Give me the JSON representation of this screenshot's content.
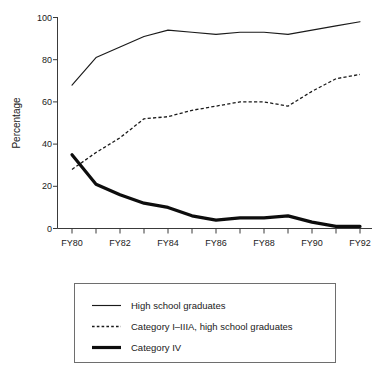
{
  "chart_data": {
    "type": "line",
    "title": "",
    "xlabel": "",
    "ylabel": "Percentage",
    "ylim": [
      0,
      100
    ],
    "yticks": [
      0,
      20,
      40,
      60,
      80,
      100
    ],
    "grid": false,
    "legend_position": "below-plot",
    "x": [
      "FY80",
      "FY81",
      "FY82",
      "FY83",
      "FY84",
      "FY85",
      "FY86",
      "FY87",
      "FY88",
      "FY89",
      "FY90",
      "FY91",
      "FY92"
    ],
    "xtick_labels": [
      "FY80",
      "FY82",
      "FY84",
      "FY86",
      "FY88",
      "FY90",
      "FY92"
    ],
    "xtick_label_years": [
      "FY80",
      "FY81",
      "FY82",
      "FY83",
      "FY84",
      "FY85",
      "FY86",
      "FY87",
      "FY88",
      "FY89",
      "FY90",
      "FY91",
      "FY92"
    ],
    "series": [
      {
        "name": "High school graduates",
        "style": "solid-thin",
        "color": "#1a1a1a",
        "values": [
          68,
          81,
          86,
          91,
          94,
          93,
          92,
          93,
          93,
          92,
          94,
          96,
          98
        ]
      },
      {
        "name": "Category I–IIIA, high school graduates",
        "style": "dashed",
        "color": "#1a1a1a",
        "values": [
          28,
          36,
          43,
          52,
          53,
          56,
          58,
          60,
          60,
          58,
          65,
          71,
          73
        ]
      },
      {
        "name": "Category IV",
        "style": "solid-thick",
        "color": "#0d0d0d",
        "values": [
          35,
          21,
          16,
          12,
          10,
          6,
          4,
          5,
          5,
          6,
          3,
          1,
          1
        ]
      }
    ]
  },
  "axes": {
    "y_label": "Percentage",
    "y_tick_0": "0",
    "y_tick_20": "20",
    "y_tick_40": "40",
    "y_tick_60": "60",
    "y_tick_80": "80",
    "y_tick_100": "100",
    "x_tick_fy80": "FY80",
    "x_tick_fy82": "FY82",
    "x_tick_fy84": "FY84",
    "x_tick_fy86": "FY86",
    "x_tick_fy88": "FY88",
    "x_tick_fy90": "FY90",
    "x_tick_fy92": "FY92"
  },
  "legend": {
    "items": [
      {
        "label": "High school graduates",
        "style": "solid-thin"
      },
      {
        "label": "Category I–IIIA, high school graduates",
        "style": "dashed"
      },
      {
        "label": "Category IV",
        "style": "solid-thick"
      }
    ]
  }
}
